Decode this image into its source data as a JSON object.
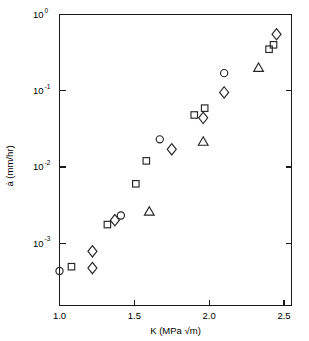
{
  "chart_data": {
    "type": "scatter",
    "title": "",
    "subtitle": "",
    "xlabel": "K  (MPa √m)",
    "xlabel_symbol": "K",
    "xlabel_units": "(MPa √m)",
    "ylabel": "ȧ  (mm/hr)",
    "ylabel_symbol": "ȧ",
    "ylabel_units": "(mm/hr)",
    "xscale": "linear",
    "yscale": "log",
    "xlim": [
      1.0,
      2.55
    ],
    "ylim": [
      0.0004,
      1.0
    ],
    "grid": false,
    "legend": false,
    "legend_position": "none",
    "xticks": [
      1.0,
      1.5,
      2.0,
      2.5
    ],
    "xticklabels": [
      "1.0",
      "1.5",
      "2.0",
      "2.5"
    ],
    "yticks": [
      1,
      0.1,
      0.01,
      0.001
    ],
    "yticklabels": [
      {
        "base": "10",
        "exp": "0"
      },
      {
        "base": "10",
        "exp": "-1"
      },
      {
        "base": "10",
        "exp": "-2"
      },
      {
        "base": "10",
        "exp": "-3"
      }
    ],
    "series": [
      {
        "name": "circle-series",
        "marker": "circle",
        "points": [
          {
            "x": 1.0,
            "y": 0.00043
          },
          {
            "x": 1.41,
            "y": 0.0023
          },
          {
            "x": 1.67,
            "y": 0.023
          },
          {
            "x": 2.1,
            "y": 0.17
          }
        ]
      },
      {
        "name": "square-series",
        "marker": "square",
        "points": [
          {
            "x": 1.08,
            "y": 0.00049
          },
          {
            "x": 1.32,
            "y": 0.00175
          },
          {
            "x": 1.51,
            "y": 0.006
          },
          {
            "x": 1.58,
            "y": 0.012
          },
          {
            "x": 1.9,
            "y": 0.048
          },
          {
            "x": 1.97,
            "y": 0.059
          },
          {
            "x": 2.4,
            "y": 0.35
          },
          {
            "x": 2.43,
            "y": 0.4
          }
        ]
      },
      {
        "name": "diamond-series",
        "marker": "diamond",
        "points": [
          {
            "x": 1.22,
            "y": 0.00078
          },
          {
            "x": 1.22,
            "y": 0.00047
          },
          {
            "x": 1.37,
            "y": 0.002
          },
          {
            "x": 1.75,
            "y": 0.017
          },
          {
            "x": 1.96,
            "y": 0.044
          },
          {
            "x": 2.1,
            "y": 0.095
          },
          {
            "x": 2.45,
            "y": 0.55
          }
        ]
      },
      {
        "name": "triangle-series",
        "marker": "triangle",
        "points": [
          {
            "x": 1.6,
            "y": 0.0026
          },
          {
            "x": 1.96,
            "y": 0.0215
          },
          {
            "x": 2.33,
            "y": 0.2
          }
        ]
      }
    ]
  },
  "colors": {
    "axis": "#1a1a1a",
    "marker": "#262626",
    "background": "#ffffff",
    "text": "#000000"
  }
}
